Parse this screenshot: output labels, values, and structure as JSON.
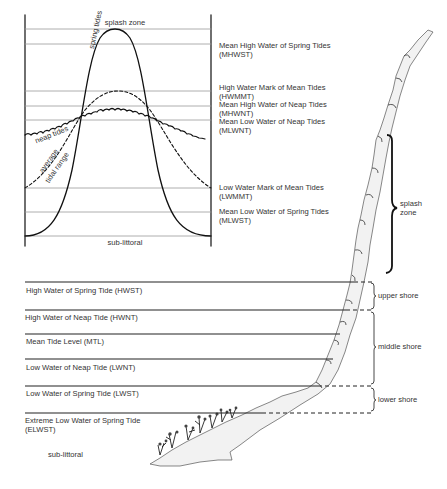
{
  "chart_top": {
    "top_label": "splash zone",
    "bottom_label": "sub-littoral",
    "curve_labels": {
      "spring": "spring tides",
      "neap": "neap tides",
      "average_line1": "average",
      "average_line2": "tidal range"
    },
    "levels": [
      {
        "name": "Mean High Water of Spring Tides",
        "abbr": "(MHWST)"
      },
      {
        "name": "High Water Mark of Mean Tides",
        "abbr": "(HWMMT)"
      },
      {
        "name": "Mean High Water of Neap Tides",
        "abbr": "(MHWNT)"
      },
      {
        "name": "Mean Low Water of Neap Tides",
        "abbr": "(MLWNT)"
      },
      {
        "name": "Low Water Mark of Mean Tides",
        "abbr": "(LWMMT)"
      },
      {
        "name": "Mean Low Water of Spring Tides",
        "abbr": "(MLWST)"
      }
    ]
  },
  "shore_profile": {
    "levels": [
      {
        "label": "High Water of Spring Tide (HWST)"
      },
      {
        "label": "High Water of Neap Tide (HWNT)"
      },
      {
        "label": "Mean Tide Level (MTL)"
      },
      {
        "label": "Low Water of Neap Tide (LWNT)"
      },
      {
        "label": "Low Water of Spring Tide (LWST)"
      },
      {
        "label": "Extreme Low Water of Spring Tide",
        "abbr": "(ELWST)"
      }
    ],
    "zones": {
      "splash_line1": "splash",
      "splash_line2": "zone",
      "upper": "upper shore",
      "middle": "middle shore",
      "lower": "lower shore",
      "sub": "sub-littoral"
    }
  }
}
